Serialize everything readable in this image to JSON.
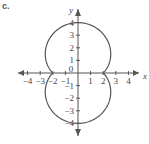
{
  "label": "c.",
  "chart_data": {
    "type": "line",
    "title": "",
    "curve": "polar r = 2 + 2|sin θ|",
    "xlabel": "x",
    "ylabel": "y",
    "xlim": [
      -4.5,
      4.5
    ],
    "ylim": [
      -4.5,
      4.5
    ],
    "x_ticks": [
      -4,
      -3,
      -2,
      -1,
      0,
      1,
      2,
      3,
      4
    ],
    "y_ticks": [
      -4,
      -3,
      -2,
      -1,
      1,
      2,
      3,
      4
    ],
    "grid": false,
    "key_points": [
      [
        2,
        0
      ],
      [
        0,
        4
      ],
      [
        -2,
        0
      ],
      [
        0,
        -4
      ]
    ],
    "color": "#555555"
  }
}
